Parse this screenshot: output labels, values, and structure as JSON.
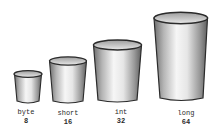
{
  "illustration": {
    "description": "Hand-drawn cups of increasing size representing Java primitive integer types and their bit widths",
    "cups": [
      {
        "type": "byte",
        "bits": "8",
        "x": 14,
        "top": 71,
        "bottom": 103,
        "width": 28,
        "label_x": 26
      },
      {
        "type": "short",
        "bits": "16",
        "x": 49,
        "top": 57,
        "bottom": 103,
        "width": 38,
        "label_x": 68
      },
      {
        "type": "int",
        "bits": "32",
        "x": 93,
        "top": 40,
        "bottom": 102,
        "width": 49,
        "label_x": 120
      },
      {
        "type": "long",
        "bits": "64",
        "x": 153,
        "top": 12,
        "bottom": 101,
        "width": 55,
        "label_x": 186
      }
    ],
    "colors": {
      "outline": "#2b2b2b",
      "shade": "#8a8a8a",
      "highlight": "#f4f4f4",
      "background": "#ffffff"
    }
  }
}
